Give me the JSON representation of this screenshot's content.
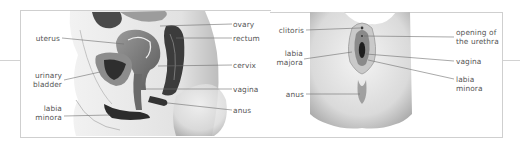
{
  "diagram": {
    "left_panel": {
      "view": "sagittal cross-section",
      "labels_left": [
        {
          "id": "uterus",
          "text": "uterus"
        },
        {
          "id": "urinary-bladder",
          "lines": [
            "urinary",
            "bladder"
          ]
        },
        {
          "id": "labia-minora",
          "lines": [
            "labia",
            "minora"
          ]
        }
      ],
      "labels_right": [
        {
          "id": "ovary",
          "text": "ovary"
        },
        {
          "id": "rectum",
          "text": "rectum"
        },
        {
          "id": "cervix",
          "text": "cervix"
        },
        {
          "id": "vagina",
          "text": "vagina"
        },
        {
          "id": "anus",
          "text": "anus"
        }
      ]
    },
    "right_panel": {
      "view": "external view",
      "labels_left": [
        {
          "id": "clitoris",
          "text": "clitoris"
        },
        {
          "id": "labia-majora",
          "lines": [
            "labia",
            "majora"
          ]
        },
        {
          "id": "anus",
          "text": "anus"
        }
      ],
      "labels_right": [
        {
          "id": "opening-of-the-urethra",
          "lines": [
            "opening of",
            "the urethra"
          ]
        },
        {
          "id": "vagina",
          "text": "vagina"
        },
        {
          "id": "labia-minora",
          "lines": [
            "labia",
            "minora"
          ]
        }
      ]
    },
    "colors": {
      "frame": "#cfcfcf",
      "leader_line": "#6e6e6e",
      "label_text": "#555555",
      "divider": "#d2d2d2"
    }
  }
}
